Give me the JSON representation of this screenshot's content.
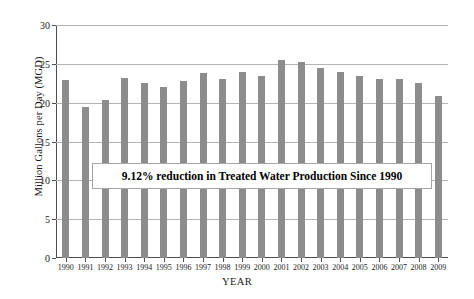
{
  "chart_data": {
    "type": "bar",
    "title": "",
    "xlabel": "YEAR",
    "ylabel": "Million Gallons per Day (MGD)",
    "ylim": [
      0,
      30
    ],
    "yticks": [
      0,
      5,
      10,
      15,
      20,
      25,
      30
    ],
    "grid": true,
    "legend": "none",
    "bar_color": "#8c8c8c",
    "categories": [
      "1990",
      "1991",
      "1992",
      "1993",
      "1994",
      "1995",
      "1996",
      "1997",
      "1998",
      "1999",
      "2000",
      "2001",
      "2002",
      "2003",
      "2004",
      "2005",
      "2006",
      "2007",
      "2008",
      "2009"
    ],
    "values": [
      22.9,
      19.4,
      20.4,
      23.2,
      22.5,
      22.0,
      22.8,
      23.8,
      23.1,
      24.0,
      23.4,
      25.5,
      25.3,
      24.5,
      24.0,
      23.4,
      23.0,
      23.0,
      22.5,
      20.8
    ],
    "annotations": [
      {
        "name": "reduction-callout",
        "text": "9.12% reduction in Treated Water Production Since 1990"
      }
    ]
  }
}
